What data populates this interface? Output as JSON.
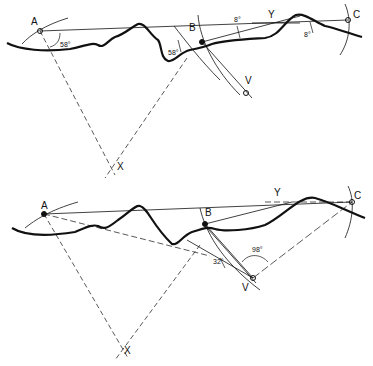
{
  "figure": {
    "top_panel": {
      "points": {
        "A": "A",
        "B": "B",
        "C": "C",
        "X": "X",
        "Y": "Y",
        "V": "V"
      },
      "angles": {
        "at_A": "58°",
        "at_B": "58°",
        "at_B_upper": "8°",
        "at_C": "8°"
      }
    },
    "bottom_panel": {
      "points": {
        "A": "A",
        "B": "B",
        "C": "C",
        "X": "X",
        "Y": "Y",
        "V": "V"
      },
      "angles": {
        "at_V_small": "32°",
        "at_V_large": "98°"
      }
    },
    "colors": {
      "ink": "#111111",
      "background": "#ffffff"
    }
  }
}
